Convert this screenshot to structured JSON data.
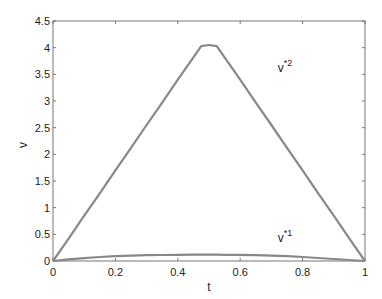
{
  "chart_data": {
    "type": "line",
    "title": "",
    "xlabel": "t",
    "ylabel": "v",
    "xlim": [
      0,
      1
    ],
    "ylim": [
      0,
      4.5
    ],
    "grid": false,
    "legend": "none (inline curve labels)",
    "x_ticks": [
      "0",
      "0.2",
      "0.4",
      "0.6",
      "0.8",
      "1"
    ],
    "y_ticks": [
      "0",
      "0.5",
      "1",
      "1.5",
      "2",
      "2.5",
      "3",
      "3.5",
      "4",
      "4.5"
    ],
    "x": [
      0,
      0.05,
      0.1,
      0.15,
      0.2,
      0.25,
      0.3,
      0.35,
      0.4,
      0.45,
      0.475,
      0.5,
      0.525,
      0.55,
      0.6,
      0.65,
      0.7,
      0.75,
      0.8,
      0.85,
      0.9,
      0.95,
      1
    ],
    "series": [
      {
        "name": "v*2",
        "values": [
          0,
          0.42,
          0.85,
          1.27,
          1.7,
          2.12,
          2.55,
          2.97,
          3.4,
          3.82,
          4.03,
          4.05,
          4.03,
          3.82,
          3.4,
          2.97,
          2.55,
          2.12,
          1.7,
          1.27,
          0.85,
          0.42,
          0
        ]
      },
      {
        "name": "v*1",
        "values": [
          0,
          0.03,
          0.055,
          0.075,
          0.09,
          0.1,
          0.108,
          0.113,
          0.116,
          0.118,
          0.118,
          0.118,
          0.118,
          0.117,
          0.114,
          0.108,
          0.1,
          0.09,
          0.075,
          0.057,
          0.038,
          0.018,
          0
        ]
      }
    ],
    "annotations": [
      {
        "text": "v",
        "sup": "*2",
        "x": 0.72,
        "y": 3.55
      },
      {
        "text": "v",
        "sup": "*1",
        "x": 0.72,
        "y": 0.35
      }
    ],
    "line_color": "#888888"
  }
}
